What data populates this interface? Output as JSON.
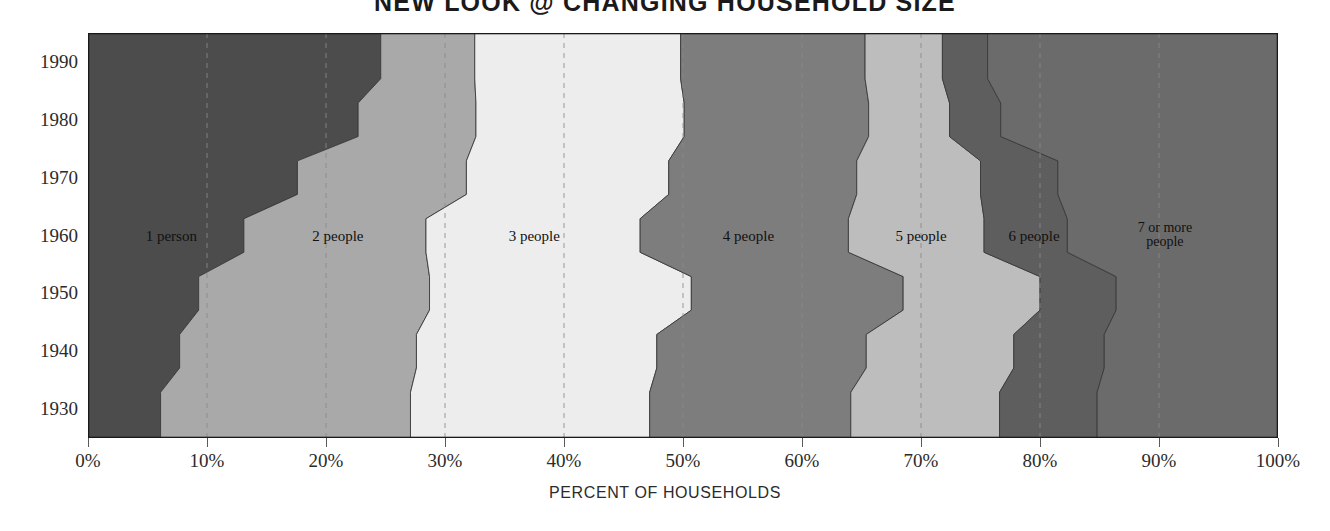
{
  "title": "NEW LOOK @ CHANGING HOUSEHOLD SIZE",
  "axis": {
    "x_caption": "PERCENT OF HOUSEHOLDS",
    "x_ticks": [
      "0%",
      "10%",
      "20%",
      "30%",
      "40%",
      "50%",
      "60%",
      "70%",
      "80%",
      "90%",
      "100%"
    ],
    "y_ticks": [
      "1990",
      "1980",
      "1970",
      "1960",
      "1950",
      "1940",
      "1930"
    ]
  },
  "colors": {
    "band_1": "#4c4c4c",
    "band_2": "#a9a9a9",
    "band_3": "#ededed",
    "band_4": "#7d7d7d",
    "band_5": "#bdbdbd",
    "band_6": "#5e5e5e",
    "band_7": "#6b6b6b",
    "plot_border": "#1a1a1a",
    "gridline": "#8a8a8a",
    "text": "#2b2b2b",
    "background": "#ffffff"
  },
  "chart_data": {
    "type": "area",
    "title": "NEW LOOK @ CHANGING HOUSEHOLD SIZE",
    "xlabel": "PERCENT OF HOUSEHOLDS",
    "ylabel": "",
    "xlim": [
      0,
      100
    ],
    "grid": true,
    "legend": "inline-band-labels",
    "stacked": true,
    "orientation": "horizontal",
    "categories": [
      "1930",
      "1940",
      "1950",
      "1960",
      "1970",
      "1980",
      "1990"
    ],
    "series": [
      {
        "name": "1 person",
        "label": "1 person",
        "color": "#4c4c4c",
        "values": [
          6.1,
          7.7,
          9.3,
          13.1,
          17.6,
          22.7,
          24.6
        ]
      },
      {
        "name": "2 people",
        "label": "2 people",
        "color": "#a9a9a9",
        "values": [
          21.0,
          19.9,
          19.4,
          15.3,
          14.2,
          9.9,
          7.9
        ]
      },
      {
        "name": "3 people",
        "label": "3 people",
        "color": "#ededed",
        "values": [
          20.1,
          20.2,
          22.0,
          18.0,
          17.0,
          17.5,
          17.3
        ]
      },
      {
        "name": "4 people",
        "label": "4 people",
        "color": "#7d7d7d",
        "values": [
          16.9,
          17.6,
          17.8,
          17.5,
          15.8,
          15.5,
          15.5
        ]
      },
      {
        "name": "5 people",
        "label": "5 people",
        "color": "#bdbdbd",
        "values": [
          12.5,
          12.4,
          11.5,
          11.4,
          10.4,
          6.8,
          6.5
        ]
      },
      {
        "name": "6 people",
        "label": "6 people",
        "color": "#5e5e5e",
        "values": [
          8.2,
          7.6,
          6.4,
          7.0,
          6.5,
          4.3,
          3.8
        ]
      },
      {
        "name": "7 or more people",
        "label": "7 or more people",
        "color": "#6b6b6b",
        "values": [
          15.2,
          14.6,
          13.6,
          17.7,
          18.5,
          23.3,
          24.4
        ]
      }
    ],
    "cumulative_boundaries": {
      "1930": [
        6.1,
        27.1,
        47.2,
        64.1,
        76.6,
        84.8,
        100.0
      ],
      "1940": [
        7.7,
        27.6,
        47.8,
        65.4,
        77.8,
        85.4,
        100.0
      ],
      "1950": [
        9.3,
        28.7,
        50.7,
        68.5,
        80.0,
        86.4,
        100.0
      ],
      "1960": [
        13.1,
        28.4,
        46.4,
        63.9,
        75.3,
        82.3,
        100.0
      ],
      "1970": [
        17.6,
        31.8,
        48.8,
        64.6,
        75.0,
        81.5,
        100.0
      ],
      "1980": [
        22.7,
        32.6,
        50.1,
        65.6,
        72.4,
        76.7,
        100.0
      ],
      "1990": [
        24.6,
        32.5,
        49.8,
        65.3,
        71.8,
        75.6,
        100.0
      ]
    }
  },
  "band_labels": [
    {
      "text": "1 person",
      "x_pct": 7.0,
      "two_line": false
    },
    {
      "text": "2 people",
      "x_pct": 21.0,
      "two_line": false
    },
    {
      "text": "3 people",
      "x_pct": 37.5,
      "two_line": false
    },
    {
      "text": "4 people",
      "x_pct": 55.5,
      "two_line": false
    },
    {
      "text": "5 people",
      "x_pct": 70.0,
      "two_line": false
    },
    {
      "text": "6 people",
      "x_pct": 79.5,
      "two_line": false
    },
    {
      "text": "7 or more people",
      "x_pct": 90.5,
      "two_line": true
    }
  ]
}
